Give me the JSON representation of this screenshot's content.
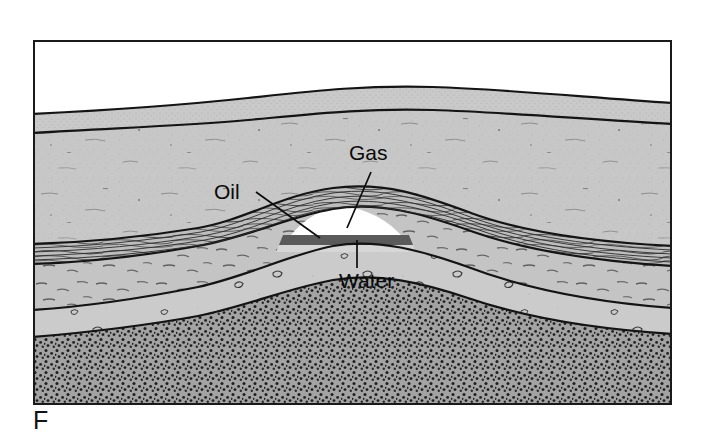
{
  "figure": {
    "panel_label": "F",
    "caption_absent": true
  },
  "diagram": {
    "type": "geologic-cross-section",
    "frame": {
      "x": 33,
      "y": 40,
      "width": 639,
      "height": 365,
      "border_color": "#1a1a1a"
    }
  },
  "labels": [
    {
      "id": "gas",
      "text": "Gas",
      "x": 349,
      "y": 142,
      "leader": {
        "from": [
          371,
          172
        ],
        "to": [
          347,
          228
        ]
      }
    },
    {
      "id": "oil",
      "text": "Oil",
      "x": 214,
      "y": 181,
      "leader": {
        "from": [
          256,
          192
        ],
        "to": [
          320,
          238
        ]
      }
    },
    {
      "id": "water",
      "text": "Water",
      "x": 339,
      "y": 270,
      "leader": {
        "from": [
          357,
          268
        ],
        "to": [
          357,
          240
        ]
      }
    }
  ],
  "layers": [
    {
      "id": "sky",
      "name": "Air above ground surface",
      "fill": "#ffffff",
      "pattern": "none"
    },
    {
      "id": "soil",
      "name": "Surface soil",
      "fill": "#c9c9c9",
      "pattern": "fine-stipple"
    },
    {
      "id": "upper-shale",
      "name": "Upper shale (cap rock)",
      "fill": "#c6c6c6",
      "pattern": "sparse-flecks"
    },
    {
      "id": "reservoir",
      "name": "Reservoir sandstone",
      "fill": "#b4b4b4",
      "pattern": "dense-streaks"
    },
    {
      "id": "mid-shale",
      "name": "Middle shale",
      "fill": "#c2c2c2",
      "pattern": "dashes"
    },
    {
      "id": "lower-unit",
      "name": "Lower sedimentary unit",
      "fill": "#cacaca",
      "pattern": "clasts"
    },
    {
      "id": "basement",
      "name": "Basement rock",
      "fill": "#9a9a9a",
      "pattern": "coarse-stipple"
    }
  ],
  "fluids": [
    {
      "id": "gas-cap",
      "name": "Gas cap",
      "fill": "#ffffff",
      "position": "crest of anticline"
    },
    {
      "id": "oil-band",
      "name": "Oil",
      "fill": "#585858",
      "position": "beneath gas cap"
    },
    {
      "id": "water-band",
      "name": "Water",
      "fill": "#d2d2d2",
      "position": "beneath oil"
    }
  ],
  "colors": {
    "ink": "#141414",
    "light_gray": "#c9c9c9",
    "mid_gray": "#b4b4b4",
    "dark_gray": "#9a9a9a",
    "oil_dark": "#585858",
    "white": "#ffffff"
  }
}
